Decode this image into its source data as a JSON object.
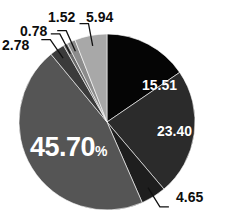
{
  "top_partial_text": "—  ———  — ——  ——  — — —— ———— —",
  "chart_data": {
    "type": "pie",
    "title": "",
    "xlabel": "",
    "ylabel": "",
    "legend": "none",
    "grid": false,
    "units": "percent",
    "total": 100.0,
    "categories": [
      "15.51",
      "23.40",
      "4.65",
      "45.70",
      "2.78",
      "0.78",
      "1.52",
      "5.94"
    ],
    "values": [
      15.51,
      23.4,
      4.65,
      45.7,
      2.78,
      0.78,
      1.52,
      5.94
    ],
    "colors": [
      "#050505",
      "#2b2b2b",
      "#1e1e1e",
      "#555555",
      "#3b3b3b",
      "#6a6a6a",
      "#8c8c8c",
      "#a8a8a8"
    ],
    "slices": [
      {
        "label": "15.51",
        "value": 15.51,
        "color": "#050505",
        "label_style": "inside",
        "leader": false
      },
      {
        "label": "23.40",
        "value": 23.4,
        "color": "#2b2b2b",
        "label_style": "inside",
        "leader": false
      },
      {
        "label": "4.65",
        "value": 4.65,
        "color": "#1e1e1e",
        "label_style": "outside",
        "leader": true
      },
      {
        "label": "45.70",
        "suffix": "%",
        "value": 45.7,
        "color": "#555555",
        "label_style": "inside-large",
        "leader": false
      },
      {
        "label": "2.78",
        "value": 2.78,
        "color": "#3b3b3b",
        "label_style": "outside",
        "leader": true
      },
      {
        "label": "0.78",
        "value": 0.78,
        "color": "#6a6a6a",
        "label_style": "outside",
        "leader": true
      },
      {
        "label": "1.52",
        "value": 1.52,
        "color": "#8c8c8c",
        "label_style": "outside",
        "leader": true
      },
      {
        "label": "5.94",
        "value": 5.94,
        "color": "#a8a8a8",
        "label_style": "outside",
        "leader": true
      }
    ],
    "geometry": {
      "center_x": 107,
      "center_y": 122,
      "radius": 88,
      "start_angle_deg": -90,
      "direction": "clockwise"
    }
  },
  "labels": {
    "s1551": "15.51",
    "s2340": "23.40",
    "s465": "4.65",
    "s4570": "45.70",
    "s4570_pct": "%",
    "s278": "2.78",
    "s078": "0.78",
    "s152": "1.52",
    "s594": "5.94"
  }
}
